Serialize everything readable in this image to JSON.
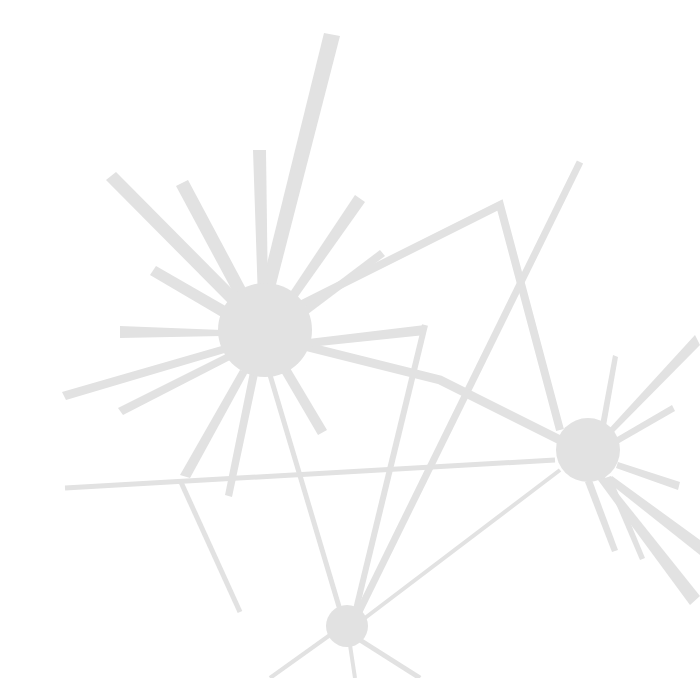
{
  "colors": {
    "background": "#ffffff",
    "shape": "#e2e2e2"
  },
  "hubs": [
    {
      "name": "large-hub",
      "cx": 265,
      "cy": 330,
      "r": 47
    },
    {
      "name": "right-hub",
      "cx": 588,
      "cy": 450,
      "r": 32
    },
    {
      "name": "bottom-hub",
      "cx": 347,
      "cy": 626,
      "r": 21
    }
  ],
  "rays": [
    [
      [
        258,
        300
      ],
      [
        324,
        33
      ],
      [
        340,
        36
      ],
      [
        272,
        300
      ]
    ],
    [
      [
        258,
        300
      ],
      [
        253,
        150
      ],
      [
        266,
        150
      ],
      [
        268,
        300
      ]
    ],
    [
      [
        240,
        305
      ],
      [
        176,
        186
      ],
      [
        188,
        180
      ],
      [
        252,
        300
      ]
    ],
    [
      [
        235,
        310
      ],
      [
        106,
        180
      ],
      [
        116,
        172
      ],
      [
        245,
        302
      ]
    ],
    [
      [
        230,
        322
      ],
      [
        150,
        275
      ],
      [
        156,
        266
      ],
      [
        236,
        312
      ]
    ],
    [
      [
        222,
        330
      ],
      [
        120,
        326
      ],
      [
        120,
        338
      ],
      [
        222,
        336
      ]
    ],
    [
      [
        225,
        345
      ],
      [
        62,
        392
      ],
      [
        66,
        400
      ],
      [
        228,
        352
      ]
    ],
    [
      [
        230,
        352
      ],
      [
        118,
        408
      ],
      [
        123,
        415
      ],
      [
        234,
        358
      ]
    ],
    [
      [
        285,
        300
      ],
      [
        355,
        195
      ],
      [
        365,
        202
      ],
      [
        292,
        305
      ]
    ],
    [
      [
        298,
        312
      ],
      [
        380,
        250
      ],
      [
        385,
        256
      ],
      [
        300,
        320
      ]
    ],
    [
      [
        300,
        340
      ],
      [
        425,
        325
      ],
      [
        425,
        335
      ],
      [
        300,
        348
      ]
    ],
    [
      [
        280,
        370
      ],
      [
        318,
        435
      ],
      [
        327,
        430
      ],
      [
        290,
        368
      ]
    ],
    [
      [
        250,
        372
      ],
      [
        225,
        495
      ],
      [
        232,
        497
      ],
      [
        258,
        374
      ]
    ],
    [
      [
        240,
        370
      ],
      [
        180,
        475
      ],
      [
        190,
        478
      ],
      [
        248,
        372
      ]
    ]
  ],
  "lines": [
    {
      "pts": [
        [
          300,
          305
        ],
        [
          500,
          205
        ],
        [
          560,
          430
        ]
      ],
      "w": 8
    },
    {
      "pts": [
        [
          580,
          162
        ],
        [
          352,
          626
        ]
      ],
      "w": 7
    },
    {
      "pts": [
        [
          425,
          325
        ],
        [
          352,
          626
        ]
      ],
      "w": 6
    },
    {
      "pts": [
        [
          300,
          345
        ],
        [
          440,
          380
        ],
        [
          560,
          440
        ]
      ],
      "w": 9
    },
    {
      "pts": [
        [
          65,
          488
        ],
        [
          555,
          460
        ]
      ],
      "w": 5
    },
    {
      "pts": [
        [
          180,
          480
        ],
        [
          240,
          612
        ]
      ],
      "w": 5
    },
    {
      "pts": [
        [
          270,
          375
        ],
        [
          340,
          610
        ]
      ],
      "w": 5
    },
    {
      "pts": [
        [
          560,
          470
        ],
        [
          365,
          618
        ]
      ],
      "w": 4
    },
    {
      "pts": [
        [
          330,
          635
        ],
        [
          270,
          678
        ]
      ],
      "w": 4
    },
    {
      "pts": [
        [
          360,
          640
        ],
        [
          420,
          678
        ]
      ],
      "w": 5
    },
    {
      "pts": [
        [
          350,
          645
        ],
        [
          355,
          678
        ]
      ],
      "w": 4
    }
  ],
  "right_rays": [
    [
      [
        600,
        425
      ],
      [
        613,
        355
      ],
      [
        618,
        357
      ],
      [
        606,
        426
      ]
    ],
    [
      [
        608,
        430
      ],
      [
        695,
        335
      ],
      [
        700,
        345
      ],
      [
        612,
        434
      ]
    ],
    [
      [
        612,
        440
      ],
      [
        672,
        405
      ],
      [
        675,
        411
      ],
      [
        614,
        446
      ]
    ],
    [
      [
        618,
        462
      ],
      [
        680,
        482
      ],
      [
        678,
        490
      ],
      [
        616,
        468
      ]
    ],
    [
      [
        605,
        478
      ],
      [
        640,
        560
      ],
      [
        645,
        558
      ],
      [
        611,
        476
      ]
    ],
    [
      [
        598,
        480
      ],
      [
        690,
        605
      ],
      [
        700,
        596
      ],
      [
        604,
        476
      ]
    ],
    [
      [
        612,
        476
      ],
      [
        700,
        540
      ],
      [
        700,
        555
      ],
      [
        608,
        482
      ]
    ],
    [
      [
        585,
        482
      ],
      [
        612,
        552
      ],
      [
        618,
        550
      ],
      [
        592,
        480
      ]
    ]
  ]
}
